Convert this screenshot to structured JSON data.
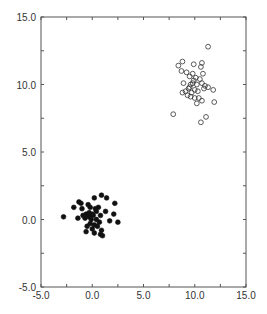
{
  "chart_data": {
    "type": "scatter",
    "title": "",
    "xlabel": "",
    "ylabel": "",
    "xlim": [
      -5.0,
      15.0
    ],
    "ylim": [
      -5.0,
      15.0
    ],
    "x_ticks": [
      "-5.0",
      "0.0",
      "5.0",
      "10.0",
      "15.0"
    ],
    "y_ticks": [
      "-5.0",
      "0.0",
      "5.0",
      "10.0",
      "15.0"
    ],
    "grid": false,
    "legend": null,
    "series": [
      {
        "name": "cluster-filled",
        "marker": "filled-circle",
        "color": "#111111",
        "points": [
          [
            -2.8,
            0.2
          ],
          [
            -1.8,
            0.9
          ],
          [
            -1.3,
            1.3
          ],
          [
            -1.1,
            1.2
          ],
          [
            -1.4,
            0.1
          ],
          [
            -1.0,
            0.8
          ],
          [
            -0.6,
            0.4
          ],
          [
            -0.4,
            1.1
          ],
          [
            -0.2,
            0.9
          ],
          [
            0.2,
            1.6
          ],
          [
            0.9,
            1.8
          ],
          [
            1.4,
            1.6
          ],
          [
            2.2,
            1.2
          ],
          [
            0.6,
            0.9
          ],
          [
            0.4,
            0.6
          ],
          [
            0.1,
            0.3
          ],
          [
            -0.3,
            0.2
          ],
          [
            -0.7,
            0.1
          ],
          [
            0.8,
            0.3
          ],
          [
            1.3,
            0.6
          ],
          [
            2.1,
            0.4
          ],
          [
            2.5,
            -0.2
          ],
          [
            1.7,
            -0.1
          ],
          [
            0.7,
            -0.2
          ],
          [
            0.2,
            -0.4
          ],
          [
            -0.2,
            -0.3
          ],
          [
            -0.5,
            -0.5
          ],
          [
            -0.6,
            -0.9
          ],
          [
            0.0,
            -0.7
          ],
          [
            0.2,
            -1.0
          ],
          [
            0.8,
            -1.1
          ],
          [
            1.0,
            -1.2
          ],
          [
            0.9,
            -0.8
          ],
          [
            0.4,
            0.0
          ],
          [
            -0.1,
            0.0
          ],
          [
            -0.3,
            0.5
          ],
          [
            0.3,
            0.8
          ],
          [
            -0.9,
            0.3
          ],
          [
            0.5,
            -0.5
          ],
          [
            0.0,
            0.4
          ]
        ]
      },
      {
        "name": "cluster-open",
        "marker": "open-circle",
        "color": "#333333",
        "points": [
          [
            11.3,
            12.8
          ],
          [
            8.8,
            11.7
          ],
          [
            8.4,
            11.4
          ],
          [
            9.9,
            11.5
          ],
          [
            10.7,
            11.6
          ],
          [
            10.6,
            11.3
          ],
          [
            8.7,
            11.0
          ],
          [
            9.2,
            10.9
          ],
          [
            9.8,
            10.8
          ],
          [
            10.8,
            10.8
          ],
          [
            9.5,
            10.6
          ],
          [
            10.1,
            10.5
          ],
          [
            10.5,
            10.4
          ],
          [
            9.9,
            10.3
          ],
          [
            8.9,
            10.1
          ],
          [
            9.6,
            10.0
          ],
          [
            10.2,
            10.0
          ],
          [
            10.7,
            10.1
          ],
          [
            11.0,
            9.9
          ],
          [
            11.3,
            9.8
          ],
          [
            11.8,
            9.6
          ],
          [
            10.9,
            9.7
          ],
          [
            9.4,
            9.7
          ],
          [
            9.1,
            9.5
          ],
          [
            8.8,
            9.4
          ],
          [
            9.7,
            9.4
          ],
          [
            10.3,
            9.5
          ],
          [
            9.3,
            9.2
          ],
          [
            9.6,
            9.1
          ],
          [
            10.0,
            9.0
          ],
          [
            10.4,
            9.0
          ],
          [
            10.7,
            8.8
          ],
          [
            10.2,
            8.6
          ],
          [
            11.9,
            8.7
          ],
          [
            7.9,
            7.8
          ],
          [
            11.1,
            7.6
          ],
          [
            10.6,
            7.2
          ],
          [
            9.5,
            9.8
          ],
          [
            10.0,
            9.6
          ],
          [
            9.8,
            10.1
          ]
        ]
      }
    ]
  }
}
